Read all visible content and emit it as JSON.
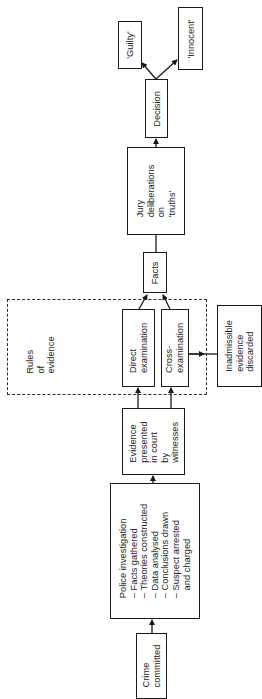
{
  "diagram": {
    "orientation": "rotated-90-ccw",
    "nodes": {
      "crime": {
        "label": "Crime\ncommitted"
      },
      "police": {
        "label": "Police investigation\n– Facts gathered\n– Theories constructed\n– Data analysed\n– Conclusions drawn\n– Suspect arrested\n   and charged"
      },
      "evidence": {
        "label": "Evidence\npresented\nin court\nby\nwitnesses"
      },
      "rules": {
        "label": "Rules\nof\nevidence"
      },
      "direct": {
        "label": "Direct\nexamination"
      },
      "cross": {
        "label": "Cross-\nexamination"
      },
      "inadmissible": {
        "label": "Inadmissible\nevidence\ndiscarded"
      },
      "facts": {
        "label": "Facts"
      },
      "jury": {
        "label": "Jury\ndeliberations\non\n'truths'"
      },
      "decision": {
        "label": "Decision"
      },
      "guilty": {
        "label": "'Guilty'"
      },
      "innocent": {
        "label": "'Innocent'"
      }
    },
    "edges": [
      {
        "from": "crime",
        "to": "police"
      },
      {
        "from": "police",
        "to": "evidence"
      },
      {
        "from": "evidence",
        "to": "direct"
      },
      {
        "from": "evidence",
        "to": "cross"
      },
      {
        "from": "cross",
        "to": "inadmissible"
      },
      {
        "from": "direct",
        "to": "facts"
      },
      {
        "from": "cross",
        "to": "facts"
      },
      {
        "from": "facts",
        "to": "jury"
      },
      {
        "from": "jury",
        "to": "decision"
      },
      {
        "from": "decision",
        "to": "guilty"
      },
      {
        "from": "decision",
        "to": "innocent"
      }
    ],
    "colors": {
      "line": "#1a1a1a",
      "background": "#ffffff"
    }
  }
}
